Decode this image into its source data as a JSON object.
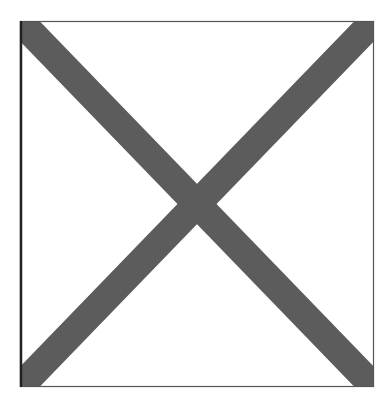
{
  "image": {
    "kind": "missing-image-placeholder",
    "icon": "x-in-box-icon",
    "frame": {
      "x1": 20,
      "y1": 21,
      "x2": 374,
      "y2": 387
    },
    "colors": {
      "background": "#ffffff",
      "frame_border": "#555555",
      "frame_border_left": "#222222",
      "cross": "#5c5c5c"
    },
    "cross_stroke_width": 28
  }
}
